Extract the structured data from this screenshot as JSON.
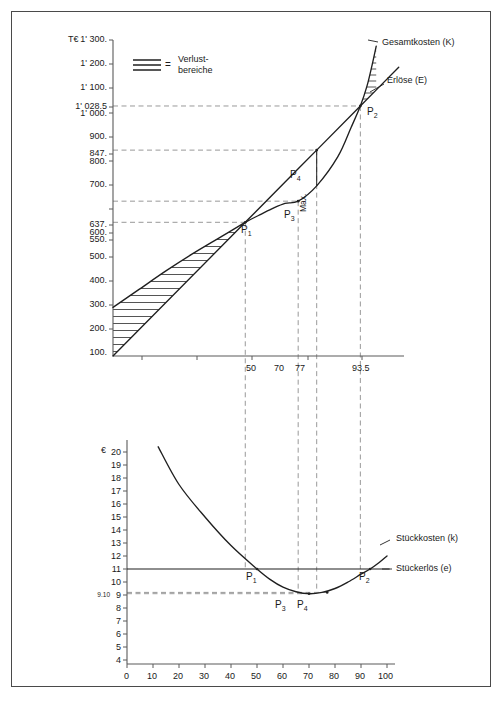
{
  "chart_data": [
    {
      "type": "line",
      "id": "total-cost-revenue",
      "title": "",
      "ylabel": "T€",
      "xlabel": "",
      "xlim": [
        0,
        110
      ],
      "ylim": [
        0,
        1300
      ],
      "grid": false,
      "legend_position": "top-left",
      "y_ticks": [
        "100.",
        "200.",
        "300.",
        "400.",
        "500.",
        "600.",
        "700.",
        "800.",
        "900.",
        "1' 000.",
        "1' 100.",
        "1' 200.",
        "1' 300."
      ],
      "y_tick_values": [
        100,
        200,
        300,
        400,
        500,
        600,
        700,
        800,
        900,
        1000,
        1100,
        1200,
        1300
      ],
      "y_special_ticks": [
        {
          "label": "1' 028.5",
          "value": 1028.5
        },
        {
          "label": "847.",
          "value": 847
        },
        {
          "label": "637.",
          "value": 637
        },
        {
          "label": "550.",
          "value": 550
        }
      ],
      "x_ticks": [
        "50",
        "70",
        "77",
        "93.5"
      ],
      "x_tick_values": [
        50,
        70,
        77,
        93.5
      ],
      "series": [
        {
          "name": "Gesamtkosten (K)",
          "label": "Gesamtkosten (K)",
          "type": "s-curve",
          "points": [
            [
              0,
              200
            ],
            [
              10,
              275
            ],
            [
              20,
              350
            ],
            [
              30,
              420
            ],
            [
              40,
              485
            ],
            [
              50,
              550
            ],
            [
              55,
              578
            ],
            [
              60,
              605
            ],
            [
              65,
              628
            ],
            [
              70,
              637
            ],
            [
              77,
              700
            ],
            [
              85,
              820
            ],
            [
              90,
              940
            ],
            [
              93.5,
              1028.5
            ],
            [
              96,
              1110
            ],
            [
              98,
              1200
            ],
            [
              99.5,
              1275
            ]
          ]
        },
        {
          "name": "Erlöse (E)",
          "label": "Erlöse (E)",
          "type": "linear-through-origin",
          "points": [
            [
              0,
              0
            ],
            [
              50,
              550
            ],
            [
              70,
              770
            ],
            [
              77,
              847
            ],
            [
              93.5,
              1028.5
            ],
            [
              100,
              1100
            ],
            [
              108,
              1188
            ]
          ]
        }
      ],
      "annotations": [
        {
          "name": "P1",
          "label": "P",
          "sub": "1",
          "x": 50,
          "y": 550
        },
        {
          "name": "P2",
          "label": "P",
          "sub": "2",
          "x": 93.5,
          "y": 1028.5
        },
        {
          "name": "P3",
          "label": "P",
          "sub": "3",
          "x": 70,
          "y": 637
        },
        {
          "name": "P4",
          "label": "P",
          "sub": "4",
          "x": 77,
          "y": 847
        },
        {
          "name": "max",
          "label": "Max."
        }
      ],
      "legend": {
        "symbol": "hatch-lines",
        "equals": "=",
        "text_line1": "Verlust-",
        "text_line2": "bereiche"
      }
    },
    {
      "type": "line",
      "id": "unit-cost-revenue",
      "title": "",
      "ylabel": "€",
      "xlabel": "",
      "xlim": [
        0,
        100
      ],
      "ylim": [
        4,
        20
      ],
      "grid": false,
      "y_ticks": [
        "4",
        "5",
        "6",
        "7",
        "8",
        "9",
        "10",
        "11",
        "12",
        "13",
        "14",
        "15",
        "16",
        "17",
        "18",
        "19",
        "20"
      ],
      "y_tick_values": [
        4,
        5,
        6,
        7,
        8,
        9,
        10,
        11,
        12,
        13,
        14,
        15,
        16,
        17,
        18,
        19,
        20
      ],
      "y_special_ticks": [
        {
          "label": "9.10",
          "value": 9.1
        }
      ],
      "x_ticks": [
        "0",
        "10",
        "20",
        "30",
        "40",
        "50",
        "60",
        "70",
        "80",
        "90",
        "100"
      ],
      "x_tick_values": [
        0,
        10,
        20,
        30,
        40,
        50,
        60,
        70,
        80,
        90,
        100
      ],
      "series": [
        {
          "name": "Stückkosten (k)",
          "label": "Stückkosten (k)",
          "type": "u-curve",
          "points": [
            [
              12,
              20.4
            ],
            [
              20,
              17.5
            ],
            [
              30,
              15.0
            ],
            [
              40,
              12.8
            ],
            [
              50,
              11.0
            ],
            [
              55,
              10.2
            ],
            [
              60,
              9.6
            ],
            [
              65,
              9.25
            ],
            [
              70,
              9.1
            ],
            [
              75,
              9.2
            ],
            [
              80,
              9.5
            ],
            [
              85,
              10.0
            ],
            [
              90,
              10.6
            ],
            [
              93.5,
              11.0
            ],
            [
              97,
              11.5
            ],
            [
              100,
              12.0
            ]
          ]
        },
        {
          "name": "Stückerlös (e)",
          "label": "Stückerlös (e)",
          "type": "horizontal",
          "value": 11,
          "points": [
            [
              0,
              11
            ],
            [
              100,
              11
            ]
          ]
        }
      ],
      "annotations": [
        {
          "name": "P1",
          "label": "P",
          "sub": "1",
          "x": 50,
          "y": 11
        },
        {
          "name": "P2",
          "label": "P",
          "sub": "2",
          "x": 93.5,
          "y": 11
        },
        {
          "name": "P3",
          "label": "P",
          "sub": "3",
          "x": 70,
          "y": 9.1
        },
        {
          "name": "P4",
          "label": "P",
          "sub": "4",
          "x": 77,
          "y": 9.2
        }
      ]
    }
  ],
  "top_chart": {
    "axis_unit": "T€",
    "y_labels": [
      {
        "text": "1' 300.",
        "v": 1300
      },
      {
        "text": "1' 200.",
        "v": 1200
      },
      {
        "text": "1' 100.",
        "v": 1100
      },
      {
        "text": "1' 028.5",
        "v": 1028.5
      },
      {
        "text": "1' 000.",
        "v": 1000
      },
      {
        "text": "900.",
        "v": 900
      },
      {
        "text": "847.",
        "v": 847
      },
      {
        "text": "800.",
        "v": 800
      },
      {
        "text": "700.",
        "v": 700
      },
      {
        "text": "637.",
        "v": 637
      },
      {
        "text": "600.",
        "v": 600
      },
      {
        "text": "550.",
        "v": 550
      },
      {
        "text": "500.",
        "v": 500
      },
      {
        "text": "400.",
        "v": 400
      },
      {
        "text": "300.",
        "v": 300
      },
      {
        "text": "200.",
        "v": 200
      },
      {
        "text": "100.",
        "v": 100
      }
    ],
    "x_labels": [
      {
        "text": "50",
        "v": 50
      },
      {
        "text": "70",
        "v": 70
      },
      {
        "text": "77",
        "v": 77
      },
      {
        "text": "93.5",
        "v": 93.5
      }
    ],
    "curve_labels": {
      "cost": "Gesamtkosten (K)",
      "revenue": "Erlöse (E)"
    },
    "legend": {
      "equals": "=",
      "line1": "Verlust-",
      "line2": "bereiche"
    },
    "max_label": "Max.",
    "points": [
      {
        "label": "P",
        "sub": "1"
      },
      {
        "label": "P",
        "sub": "2"
      },
      {
        "label": "P",
        "sub": "3"
      },
      {
        "label": "P",
        "sub": "4"
      }
    ]
  },
  "bottom_chart": {
    "axis_unit": "€",
    "y_labels": [
      {
        "text": "20",
        "v": 20
      },
      {
        "text": "19",
        "v": 19
      },
      {
        "text": "18",
        "v": 18
      },
      {
        "text": "17",
        "v": 17
      },
      {
        "text": "16",
        "v": 16
      },
      {
        "text": "15",
        "v": 15
      },
      {
        "text": "14",
        "v": 14
      },
      {
        "text": "13",
        "v": 13
      },
      {
        "text": "12",
        "v": 12
      },
      {
        "text": "11",
        "v": 11
      },
      {
        "text": "10",
        "v": 10
      },
      {
        "text": "9",
        "v": 9
      },
      {
        "text": "8",
        "v": 8
      },
      {
        "text": "7",
        "v": 7
      },
      {
        "text": "6",
        "v": 6
      },
      {
        "text": "5",
        "v": 5
      },
      {
        "text": "4",
        "v": 4
      }
    ],
    "y_special": {
      "text": "9.10",
      "v": 9.1
    },
    "x_labels": [
      {
        "text": "0",
        "v": 0
      },
      {
        "text": "10",
        "v": 10
      },
      {
        "text": "20",
        "v": 20
      },
      {
        "text": "30",
        "v": 30
      },
      {
        "text": "40",
        "v": 40
      },
      {
        "text": "50",
        "v": 50
      },
      {
        "text": "60",
        "v": 60
      },
      {
        "text": "70",
        "v": 70
      },
      {
        "text": "80",
        "v": 80
      },
      {
        "text": "90",
        "v": 90
      },
      {
        "text": "100",
        "v": 100
      }
    ],
    "curve_labels": {
      "unit_cost": "Stückkosten (k)",
      "unit_revenue": "Stückerlös (e)"
    },
    "points": [
      {
        "label": "P",
        "sub": "1"
      },
      {
        "label": "P",
        "sub": "2"
      },
      {
        "label": "P",
        "sub": "3"
      },
      {
        "label": "P",
        "sub": "4"
      }
    ]
  },
  "colors": {
    "ink": "#1a1a1a",
    "axis": "#555555",
    "dash": "#8a8a8a",
    "frame": "#4a4a4a"
  }
}
